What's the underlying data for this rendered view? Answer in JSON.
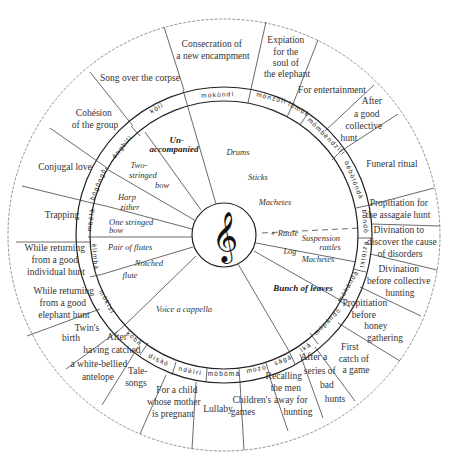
{
  "diagram": {
    "center_symbol": "𝄞",
    "center_symbol_name": "treble-clef",
    "outer_segments": [
      {
        "id": "consecration",
        "label": [
          "Consecration of",
          "a new encampment"
        ]
      },
      {
        "id": "expiation",
        "label": [
          "Expiation",
          "for the",
          "soul of",
          "the elephant"
        ]
      },
      {
        "id": "entertainment",
        "label": [
          "For entertainment"
        ]
      },
      {
        "id": "after-good-collective-hunt",
        "label": [
          "After",
          "a good",
          "collective",
          "hunt"
        ]
      },
      {
        "id": "funeral-ritual",
        "label": [
          "Funeral ritual"
        ]
      },
      {
        "id": "propitiation-assagaie",
        "label": [
          "Propitiation for",
          "the assagaie hunt"
        ]
      },
      {
        "id": "divination-disorders",
        "label": [
          "Divination to",
          "discover  the cause",
          "of disorders"
        ]
      },
      {
        "id": "divination-collective",
        "label": [
          "Divination",
          "before collective",
          "hunting"
        ]
      },
      {
        "id": "propitiation-honey",
        "label": [
          "Propitiation",
          "before",
          "honey",
          "gathering"
        ]
      },
      {
        "id": "first-catch",
        "label": [
          "First",
          "catch of",
          "a game"
        ]
      },
      {
        "id": "after-bad-hunts",
        "label": [
          "After a",
          "series of",
          "bad",
          "hunts"
        ]
      },
      {
        "id": "recalling-men",
        "label": [
          "Recalling",
          "the men",
          "away for",
          "hunting"
        ]
      },
      {
        "id": "childrens-games",
        "label": [
          "Children's",
          "games"
        ]
      },
      {
        "id": "lullaby",
        "label": [
          "Lullaby"
        ]
      },
      {
        "id": "child-pregnant",
        "label": [
          "For a child",
          "whose mother",
          "is pregnant"
        ]
      },
      {
        "id": "tale-songs",
        "label": [
          "Tale-",
          "songs"
        ]
      },
      {
        "id": "white-bellied",
        "label": [
          "After",
          "having catched",
          "a white-bellied",
          "antelope"
        ]
      },
      {
        "id": "twins-birth",
        "label": [
          "Twin's",
          "birth"
        ]
      },
      {
        "id": "returning-elephant",
        "label": [
          "While returning",
          "from a good",
          "elephant hunt"
        ]
      },
      {
        "id": "returning-individual",
        "label": [
          "While returning",
          "from a good",
          "individual hunt"
        ]
      },
      {
        "id": "trapping",
        "label": [
          "Trapping"
        ]
      },
      {
        "id": "conjugal-love",
        "label": [
          "Conjugal love"
        ]
      },
      {
        "id": "cohesion",
        "label": [
          "Cohésion",
          "of the group"
        ]
      },
      {
        "id": "song-corpse",
        "label": [
          "Song over the corpse"
        ]
      }
    ],
    "ring_labels": [
      "kòlì",
      "mòkòndì",
      "mònzólì",
      "ìómbè",
      "mòmbèndzìlì",
      "bèbòlòndà",
      "bòndò",
      "èzìbìkì",
      "mòkàndà",
      "mòpàndò",
      "ìkà",
      "sàgà",
      "mòzò",
      "mòbòmà",
      "ndèìrì",
      "dìsàò",
      "kòbà",
      "mòkìsì",
      "èlìmbà",
      "mbèlà",
      "bògòngò",
      "èngbìlì"
    ],
    "inner_labels": [
      {
        "id": "unaccompanied",
        "text": [
          "Un-",
          "accompanied"
        ],
        "style": "bold"
      },
      {
        "id": "drums",
        "text": [
          "Drums"
        ]
      },
      {
        "id": "sticks",
        "text": [
          "Sticks"
        ]
      },
      {
        "id": "machetes-top",
        "text": [
          "Machetes"
        ]
      },
      {
        "id": "two-stringed-bow",
        "text": [
          "Two-",
          "stringed",
          "bow"
        ]
      },
      {
        "id": "harp-zither",
        "text": [
          "Harp",
          "zither"
        ]
      },
      {
        "id": "one-stringed-bow",
        "text": [
          "One stringed",
          "bow"
        ]
      },
      {
        "id": "pair-of-flutes",
        "text": [
          "Pair of flutes"
        ]
      },
      {
        "id": "notched-flute",
        "text": [
          "Notched",
          "flute"
        ]
      },
      {
        "id": "voice-a-cappella",
        "text": [
          "Voice a cappella"
        ]
      },
      {
        "id": "rattle",
        "text": [
          "+ Rattle"
        ]
      },
      {
        "id": "suspension-rattles",
        "text": [
          "Suspension",
          "rattles"
        ]
      },
      {
        "id": "log",
        "text": [
          "Log"
        ]
      },
      {
        "id": "machetes-bottom",
        "text": [
          "Machetes"
        ]
      },
      {
        "id": "bunch-of-leaves",
        "text": [
          "Bunch of leaves"
        ],
        "style": "bold"
      }
    ]
  }
}
